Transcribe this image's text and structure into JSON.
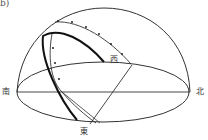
{
  "figure": {
    "panel_label": "b)",
    "directions": {
      "south": "南",
      "north": "北",
      "east": "東",
      "west": "西"
    },
    "colors": {
      "line": "#222222",
      "background": "#ffffff"
    }
  }
}
